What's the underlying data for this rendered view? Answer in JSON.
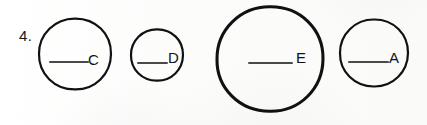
{
  "worksheet": {
    "item_number": "4.",
    "background_color": "#fdfdfc",
    "ink_color": "#111113",
    "blank_line_color": "#4a4a4e"
  },
  "circles": [
    {
      "letter": "C",
      "size_label": "large",
      "center_x": 75,
      "center_y": 54,
      "radius": 36,
      "blank_line": {
        "x": 49,
        "y": 61,
        "width": 40
      },
      "letter_x": 88,
      "letter_y": 52
    },
    {
      "letter": "D",
      "size_label": "small",
      "center_x": 157,
      "center_y": 55,
      "radius": 26,
      "blank_line": {
        "x": 137,
        "y": 62,
        "width": 31
      },
      "letter_x": 168,
      "letter_y": 50
    },
    {
      "letter": "E",
      "size_label": "largest",
      "center_x": 270,
      "center_y": 59,
      "radius": 53,
      "blank_line": {
        "x": 248,
        "y": 62,
        "width": 45
      },
      "letter_x": 296,
      "letter_y": 50
    },
    {
      "letter": "A",
      "size_label": "medium",
      "center_x": 374,
      "center_y": 53,
      "radius": 34,
      "blank_line": {
        "x": 348,
        "y": 61,
        "width": 41
      },
      "letter_x": 389,
      "letter_y": 50
    }
  ]
}
